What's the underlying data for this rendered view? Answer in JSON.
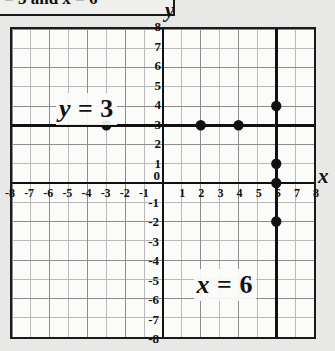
{
  "caption": {
    "text_fragment": "= 3 and x = 6",
    "visible_prefix": "=",
    "italic_var": "x"
  },
  "graph": {
    "axis_labels": {
      "x": "x",
      "y": "y"
    },
    "origin_label": "0",
    "x_ticks_negative": [
      "-8",
      "-7",
      "-6",
      "-5",
      "-4",
      "-3",
      "-2",
      "-1"
    ],
    "x_ticks_positive": [
      "1",
      "2",
      "3",
      "4",
      "5",
      "6",
      "7",
      "8"
    ],
    "y_ticks_positive": [
      "1",
      "2",
      "3",
      "4",
      "5",
      "6",
      "7",
      "8"
    ],
    "y_ticks_negative": [
      "-1",
      "-2",
      "-3",
      "-4",
      "-5",
      "-6",
      "-7",
      "-8"
    ],
    "x_range": [
      -8,
      8
    ],
    "y_range": [
      -8,
      8
    ],
    "colors": {
      "grid_minor": "#b9b9b9",
      "grid_major": "#4a4a4a",
      "axis": "#111111",
      "line": "#111111",
      "point": "#111111",
      "plate_background": "#fbfbfa",
      "page_background": "#e8e8e6"
    },
    "annotations": [
      {
        "text_var": "y",
        "text_op": "= 3",
        "at_x": -5.6,
        "at_y": 4.6
      },
      {
        "text_var": "x",
        "text_op": "= 6",
        "at_x": 1.6,
        "at_y": -4.4
      }
    ]
  },
  "chart_data": {
    "type": "scatter",
    "title": "",
    "xlabel": "x",
    "ylabel": "y",
    "xlim": [
      -8,
      8
    ],
    "ylim": [
      -8,
      8
    ],
    "grid": true,
    "legend": "none",
    "lines": [
      {
        "name": "y = 3",
        "kind": "horizontal",
        "value": 3,
        "label": "y = 3"
      },
      {
        "name": "x = 6",
        "kind": "vertical",
        "value": 6,
        "label": "x = 6"
      }
    ],
    "series": [
      {
        "name": "points on y = 3",
        "points": [
          {
            "x": -3,
            "y": 3
          },
          {
            "x": 2,
            "y": 3
          },
          {
            "x": 4,
            "y": 3
          }
        ]
      },
      {
        "name": "points on x = 6",
        "points": [
          {
            "x": 6,
            "y": 4
          },
          {
            "x": 6,
            "y": 1
          },
          {
            "x": 6,
            "y": 0
          },
          {
            "x": 6,
            "y": -2
          }
        ]
      }
    ]
  }
}
